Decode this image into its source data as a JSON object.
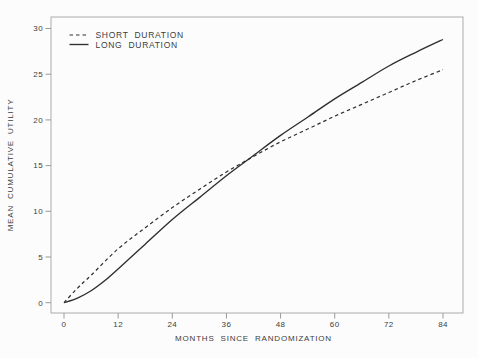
{
  "figure": {
    "background": "#fcfcfc",
    "frame_color": "#ababab",
    "tick_color": "#9a9a9a",
    "line_color": "#2e2e2e",
    "text_color": "#3c3c3c"
  },
  "chart_data": {
    "type": "line",
    "title": "",
    "xlabel": "MONTHS SINCE RANDOMIZATION",
    "ylabel": "MEAN CUMULATIVE UTILITY",
    "xlim": [
      0,
      84
    ],
    "ylim": [
      0,
      30
    ],
    "x_ticks": [
      0,
      12,
      24,
      36,
      48,
      60,
      72,
      84
    ],
    "y_ticks": [
      0,
      5,
      10,
      15,
      20,
      25,
      30
    ],
    "grid": false,
    "frame": true,
    "legend_position": "top-left-inside",
    "series": [
      {
        "name": "SHORT DURATION",
        "style": "dashed",
        "points": [
          [
            0,
            0
          ],
          [
            3,
            1.6
          ],
          [
            6,
            3.0
          ],
          [
            12,
            5.9
          ],
          [
            18,
            8.2
          ],
          [
            24,
            10.4
          ],
          [
            30,
            12.4
          ],
          [
            36,
            14.3
          ],
          [
            42,
            16.0
          ],
          [
            48,
            17.6
          ],
          [
            54,
            19.0
          ],
          [
            60,
            20.4
          ],
          [
            66,
            21.7
          ],
          [
            72,
            23.0
          ],
          [
            78,
            24.3
          ],
          [
            84,
            25.5
          ]
        ]
      },
      {
        "name": "LONG DURATION",
        "style": "solid",
        "points": [
          [
            0,
            0
          ],
          [
            3,
            0.5
          ],
          [
            6,
            1.3
          ],
          [
            9,
            2.4
          ],
          [
            12,
            3.7
          ],
          [
            18,
            6.4
          ],
          [
            24,
            9.1
          ],
          [
            30,
            11.5
          ],
          [
            36,
            13.9
          ],
          [
            42,
            16.1
          ],
          [
            48,
            18.3
          ],
          [
            54,
            20.3
          ],
          [
            60,
            22.3
          ],
          [
            66,
            24.1
          ],
          [
            72,
            25.9
          ],
          [
            78,
            27.4
          ],
          [
            84,
            28.8
          ]
        ]
      }
    ]
  }
}
